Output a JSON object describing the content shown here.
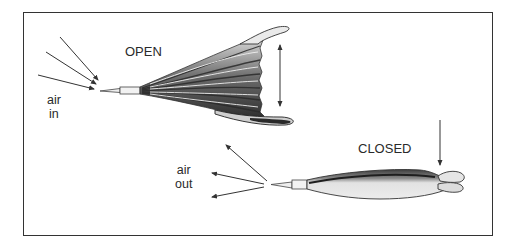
{
  "figure": {
    "labels": {
      "open": "OPEN",
      "closed": "CLOSED",
      "air_in_line1": "air",
      "air_in_line2": "in",
      "air_out_line1": "air",
      "air_out_line2": "out"
    },
    "states": [
      {
        "name": "open",
        "label": "OPEN",
        "airflow": "air in"
      },
      {
        "name": "closed",
        "label": "CLOSED",
        "airflow": "air out"
      }
    ],
    "colors": {
      "frame": "#333333",
      "ink": "#3a3a3a",
      "bellows_dark": "#4a4a4a",
      "bellows_light": "#e6e6e6"
    }
  }
}
